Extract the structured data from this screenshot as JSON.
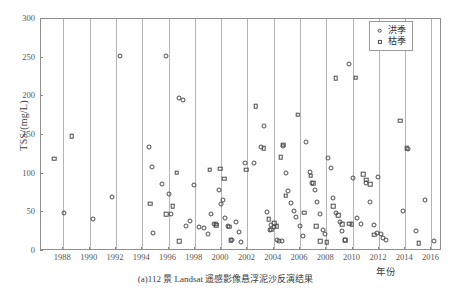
{
  "figure": {
    "caption": "(a)112 景 Landsat 遥感影像悬浮泥沙反演结果",
    "xlabel": "年份",
    "ylabel": "TSS/(mg/L)"
  },
  "legend": {
    "position": "top-right",
    "entries": [
      {
        "label": "洪季",
        "marker": "circle-icon"
      },
      {
        "label": "枯季",
        "marker": "square-icon"
      }
    ]
  },
  "axis": {
    "y_ticks": [
      "0",
      "50",
      "100",
      "150",
      "200",
      "250",
      "300"
    ],
    "x_ticks": [
      "1988",
      "1990",
      "1992",
      "1994",
      "1996",
      "1998",
      "2000",
      "2002",
      "2004",
      "2006",
      "2008",
      "2010",
      "2012",
      "2014",
      "2016"
    ]
  },
  "chart_data": {
    "type": "scatter",
    "title": "(a)112 景 Landsat 遥感影像悬浮泥沙反演结果",
    "xlabel": "年份",
    "ylabel": "TSS/(mg/L)",
    "xlim": [
      1986.3,
      2016.8
    ],
    "ylim": [
      0,
      300
    ],
    "ytick_interval": 50,
    "xtick_interval": 2,
    "grid": "vertical-only",
    "legend_position": "top-right",
    "marker_edge_color": "#4a4a4a",
    "marker_face_color": "none",
    "series": [
      {
        "name": "洪季",
        "marker": "circle",
        "points": [
          [
            1988.1,
            48
          ],
          [
            1990.3,
            40
          ],
          [
            1991.8,
            68
          ],
          [
            1992.4,
            251
          ],
          [
            1994.6,
            133
          ],
          [
            1994.8,
            107
          ],
          [
            1994.9,
            22
          ],
          [
            1995.6,
            85
          ],
          [
            1995.9,
            251
          ],
          [
            1996.1,
            72
          ],
          [
            1996.3,
            46
          ],
          [
            1996.9,
            197
          ],
          [
            1997.2,
            194
          ],
          [
            1997.4,
            31
          ],
          [
            1997.7,
            37
          ],
          [
            1998.0,
            84
          ],
          [
            1998.4,
            30
          ],
          [
            1998.8,
            28
          ],
          [
            1999.1,
            21
          ],
          [
            1999.3,
            47
          ],
          [
            1999.5,
            33
          ],
          [
            1999.7,
            33
          ],
          [
            1999.9,
            77
          ],
          [
            2000.1,
            59
          ],
          [
            2000.2,
            65
          ],
          [
            2000.4,
            42
          ],
          [
            2000.6,
            31
          ],
          [
            2000.9,
            13
          ],
          [
            2001.2,
            36
          ],
          [
            2001.4,
            23
          ],
          [
            2001.6,
            10
          ],
          [
            2001.9,
            113
          ],
          [
            2002.6,
            113
          ],
          [
            2003.1,
            133
          ],
          [
            2003.3,
            160
          ],
          [
            2003.6,
            49
          ],
          [
            2003.8,
            26
          ],
          [
            2003.9,
            32
          ],
          [
            2004.1,
            30
          ],
          [
            2004.3,
            13
          ],
          [
            2004.5,
            12
          ],
          [
            2004.7,
            11
          ],
          [
            2004.8,
            135
          ],
          [
            2005.0,
            100
          ],
          [
            2005.2,
            76
          ],
          [
            2005.4,
            61
          ],
          [
            2005.6,
            50
          ],
          [
            2005.8,
            43
          ],
          [
            2006.1,
            31
          ],
          [
            2006.3,
            18
          ],
          [
            2006.5,
            140
          ],
          [
            2006.8,
            101
          ],
          [
            2007.0,
            87
          ],
          [
            2007.2,
            78
          ],
          [
            2007.4,
            62
          ],
          [
            2007.6,
            47
          ],
          [
            2007.8,
            26
          ],
          [
            2008.0,
            21
          ],
          [
            2008.2,
            119
          ],
          [
            2008.4,
            106
          ],
          [
            2008.6,
            67
          ],
          [
            2008.8,
            48
          ],
          [
            2009.1,
            36
          ],
          [
            2009.3,
            24
          ],
          [
            2009.5,
            13
          ],
          [
            2009.8,
            240
          ],
          [
            2010.1,
            93
          ],
          [
            2010.4,
            41
          ],
          [
            2010.7,
            33
          ],
          [
            2011.1,
            86
          ],
          [
            2011.4,
            62
          ],
          [
            2011.7,
            32
          ],
          [
            2011.9,
            22
          ],
          [
            2012.0,
            95
          ],
          [
            2012.2,
            21
          ],
          [
            2012.4,
            16
          ],
          [
            2012.6,
            13
          ],
          [
            2013.9,
            50
          ],
          [
            2014.3,
            131
          ],
          [
            2014.9,
            25
          ],
          [
            2015.6,
            65
          ],
          [
            2016.3,
            11
          ]
        ]
      },
      {
        "name": "枯季",
        "marker": "square",
        "points": [
          [
            1987.4,
            118
          ],
          [
            1988.7,
            147
          ],
          [
            1994.7,
            60
          ],
          [
            1995.9,
            46
          ],
          [
            1996.4,
            57
          ],
          [
            1996.7,
            100
          ],
          [
            1996.9,
            11
          ],
          [
            1999.2,
            104
          ],
          [
            1999.7,
            32
          ],
          [
            2000.0,
            105
          ],
          [
            2000.3,
            92
          ],
          [
            2000.7,
            30
          ],
          [
            2000.8,
            13
          ],
          [
            2002.0,
            104
          ],
          [
            2002.7,
            186
          ],
          [
            2003.3,
            132
          ],
          [
            2003.7,
            40
          ],
          [
            2003.9,
            26
          ],
          [
            2004.1,
            35
          ],
          [
            2004.3,
            31
          ],
          [
            2004.6,
            120
          ],
          [
            2004.8,
            136
          ],
          [
            2005.0,
            70
          ],
          [
            2005.9,
            175
          ],
          [
            2006.4,
            48
          ],
          [
            2006.9,
            96
          ],
          [
            2007.1,
            86
          ],
          [
            2007.3,
            31
          ],
          [
            2007.6,
            11
          ],
          [
            2008.1,
            10
          ],
          [
            2008.6,
            57
          ],
          [
            2008.8,
            222
          ],
          [
            2009.0,
            45
          ],
          [
            2009.3,
            33
          ],
          [
            2009.5,
            13
          ],
          [
            2009.8,
            34
          ],
          [
            2010.0,
            33
          ],
          [
            2010.3,
            223
          ],
          [
            2010.9,
            98
          ],
          [
            2011.1,
            91
          ],
          [
            2011.4,
            85
          ],
          [
            2011.7,
            20
          ],
          [
            2013.7,
            167
          ],
          [
            2014.2,
            132
          ],
          [
            2015.1,
            9
          ]
        ]
      }
    ]
  }
}
